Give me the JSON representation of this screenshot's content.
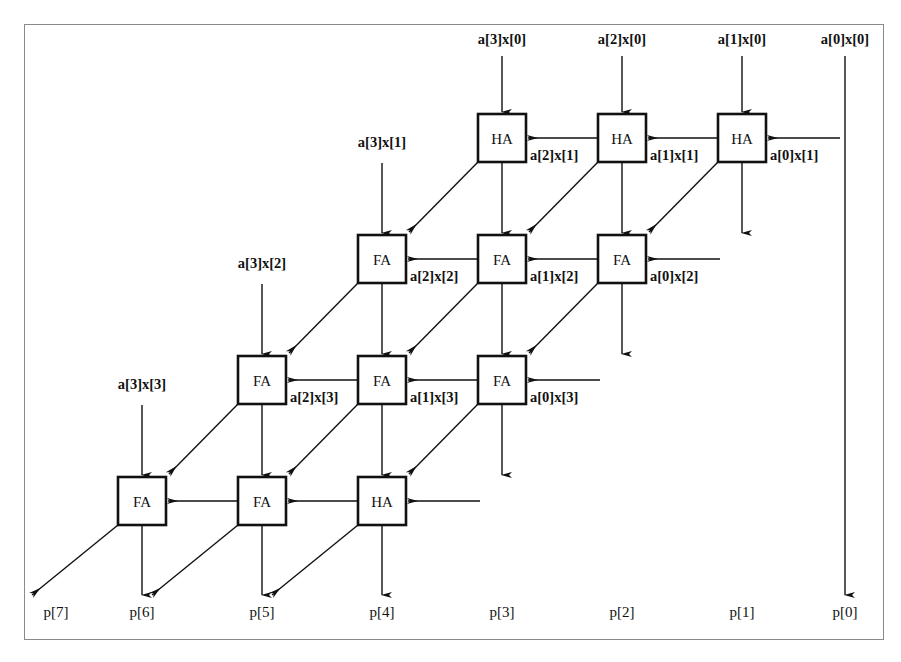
{
  "diagram": {
    "type": "schematic",
    "frame": {
      "x": 24,
      "y": 24,
      "width": 860,
      "height": 616,
      "border_color": "#8a8a8a"
    },
    "geometry": {
      "cell_size": 48,
      "col_pitch": 120,
      "row_pitch": 121,
      "row_tops": [
        114,
        235,
        356,
        477
      ],
      "row0_col_lefts": [
        478,
        598,
        718
      ],
      "row1_col_lefts": [
        358,
        478,
        598
      ],
      "row2_col_lefts": [
        238,
        358,
        478
      ],
      "row3_col_lefts": [
        118,
        238,
        358
      ],
      "top_label_y": 44,
      "bottom_label_y": 617,
      "passthrough_x": 845
    },
    "colors": {
      "line": "#111111",
      "box_stroke": "#111111",
      "box_fill": "#ffffff",
      "frame": "#8a8a8a"
    },
    "rows": [
      {
        "index": 0,
        "cells": [
          {
            "type": "HA",
            "col": 0,
            "top_input": "a[3]x[0]",
            "side_input": "a[2]x[1]"
          },
          {
            "type": "HA",
            "col": 1,
            "top_input": "a[2]x[0]",
            "side_input": "a[1]x[1]"
          },
          {
            "type": "HA",
            "col": 2,
            "top_input": "a[1]x[0]",
            "side_input": "a[0]x[1]"
          }
        ]
      },
      {
        "index": 1,
        "cells": [
          {
            "type": "FA",
            "col": 0,
            "top_input": "a[3]x[1]",
            "side_input": "a[2]x[2]"
          },
          {
            "type": "FA",
            "col": 1,
            "top_input": "",
            "side_input": "a[1]x[2]"
          },
          {
            "type": "FA",
            "col": 2,
            "top_input": "",
            "side_input": "a[0]x[2]"
          }
        ]
      },
      {
        "index": 2,
        "cells": [
          {
            "type": "FA",
            "col": 0,
            "top_input": "a[3]x[2]",
            "side_input": "a[2]x[3]"
          },
          {
            "type": "FA",
            "col": 1,
            "top_input": "",
            "side_input": "a[1]x[3]"
          },
          {
            "type": "FA",
            "col": 2,
            "top_input": "",
            "side_input": "a[0]x[3]"
          }
        ]
      },
      {
        "index": 3,
        "cells": [
          {
            "type": "FA",
            "col": 0,
            "top_input": "a[3]x[3]",
            "side_input": ""
          },
          {
            "type": "FA",
            "col": 1,
            "top_input": "",
            "side_input": ""
          },
          {
            "type": "HA",
            "col": 2,
            "top_input": "",
            "side_input": ""
          }
        ]
      }
    ],
    "top_inputs": [
      {
        "label": "a[3]x[0]",
        "x": 502
      },
      {
        "label": "a[2]x[0]",
        "x": 622
      },
      {
        "label": "a[1]x[0]",
        "x": 742
      },
      {
        "label": "a[0]x[0]",
        "x": 845
      }
    ],
    "left_inputs": [
      {
        "label": "a[3]x[1]",
        "x": 382,
        "y": 147
      },
      {
        "label": "a[3]x[2]",
        "x": 262,
        "y": 268
      },
      {
        "label": "a[3]x[3]",
        "x": 142,
        "y": 389
      }
    ],
    "side_inputs": [
      {
        "label": "a[2]x[1]",
        "x": 530,
        "y": 160
      },
      {
        "label": "a[1]x[1]",
        "x": 650,
        "y": 160
      },
      {
        "label": "a[0]x[1]",
        "x": 770,
        "y": 160
      },
      {
        "label": "a[2]x[2]",
        "x": 410,
        "y": 281
      },
      {
        "label": "a[1]x[2]",
        "x": 530,
        "y": 281
      },
      {
        "label": "a[0]x[2]",
        "x": 650,
        "y": 281
      },
      {
        "label": "a[2]x[3]",
        "x": 290,
        "y": 402
      },
      {
        "label": "a[1]x[3]",
        "x": 410,
        "y": 402
      },
      {
        "label": "a[0]x[3]",
        "x": 530,
        "y": 402
      }
    ],
    "outputs": [
      {
        "label": "p[7]",
        "x": 56
      },
      {
        "label": "p[6]",
        "x": 142
      },
      {
        "label": "p[5]",
        "x": 262
      },
      {
        "label": "p[4]",
        "x": 382
      },
      {
        "label": "p[3]",
        "x": 502
      },
      {
        "label": "p[2]",
        "x": 622
      },
      {
        "label": "p[1]",
        "x": 742
      },
      {
        "label": "p[0]",
        "x": 845
      }
    ]
  }
}
